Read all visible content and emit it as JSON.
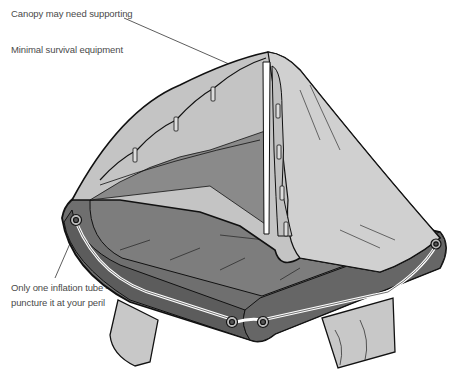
{
  "diagram": {
    "colors": {
      "tube": "#6f6f6f",
      "tube_dark": "#5a5a5a",
      "floor": "#7a7a7a",
      "canopy": "#c4c4c4",
      "canopy_light": "#d4d4d4",
      "outline": "#111111",
      "rope": "#ffffff"
    },
    "annotations": [
      {
        "id": "canopy",
        "text": "Canopy may need supporting"
      },
      {
        "id": "equipment",
        "text": "Minimal survival equipment"
      },
      {
        "id": "tube_line1",
        "text": "Only one inflation tube –"
      },
      {
        "id": "tube_line2",
        "text": "puncture it at your peril"
      }
    ]
  }
}
